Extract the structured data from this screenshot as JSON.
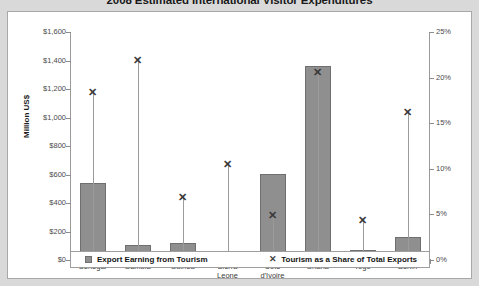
{
  "chart_data": {
    "type": "bar",
    "title": "2008 Estimated International Visitor Expenditures",
    "xlabel": "",
    "ylabel": "Million US$",
    "y2label": "",
    "ylim": [
      0,
      1600
    ],
    "y2lim": [
      0,
      25
    ],
    "grid": false,
    "legend_position": "bottom",
    "categories": [
      "Senegal",
      "Gambia",
      "Guinea",
      "Sierra\nLeone",
      "Cote\nd'Ivoire",
      "Ghana",
      "Togo",
      "Benin"
    ],
    "yticks": [
      "$0",
      "$200",
      "$400",
      "$600",
      "$800",
      "$1,000",
      "$1,200",
      "$1,400",
      "$1,600"
    ],
    "ytick_values": [
      0,
      200,
      400,
      600,
      800,
      1000,
      1200,
      1400,
      1600
    ],
    "y2ticks": [
      "0%",
      "5%",
      "10%",
      "15%",
      "20%",
      "25%"
    ],
    "y2tick_values": [
      0,
      5,
      10,
      15,
      20,
      25
    ],
    "series": [
      {
        "name": "Export Earning from Tourism",
        "type": "bar",
        "axis": "left",
        "unit": "Million US$",
        "values": [
          535,
          100,
          115,
          38,
          600,
          1355,
          60,
          155
        ]
      },
      {
        "name": "Tourism as a Share of Total Exports",
        "type": "scatter",
        "marker": "x",
        "axis": "right",
        "unit": "%",
        "values": [
          18.4,
          21.9,
          6.9,
          10.5,
          4.9,
          20.6,
          4.3,
          16.2
        ]
      }
    ]
  },
  "legend": {
    "bar_label": "Export Earning from Tourism",
    "marker_label": "Tourism as a Share of Total Exports",
    "marker_glyph": "✕"
  },
  "marker_glyph": "✕"
}
